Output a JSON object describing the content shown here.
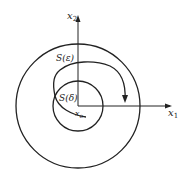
{
  "diagram": {
    "axis_x_label": "x",
    "axis_x_sub": "1",
    "axis_y_label": "x",
    "axis_y_sub": "2",
    "outer_circle_label": "S(ε)",
    "inner_circle_label": "S(δ)",
    "equilibrium_label": "x",
    "equilibrium_sub": "e"
  }
}
